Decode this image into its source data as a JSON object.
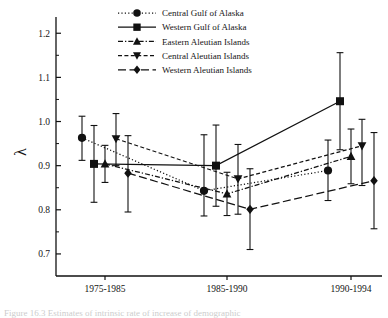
{
  "figure": {
    "background_color": "#ffffff",
    "ink_color": "#111111",
    "caption_partial": "Figure 16.3  Estimates of intrinsic rate of increase of demographic"
  },
  "chart_data": {
    "type": "line",
    "title": "",
    "xlabel": "",
    "ylabel": "λ",
    "categories": [
      "1975-1985",
      "1985-1990",
      "1990-1994"
    ],
    "ylim": [
      0.65,
      1.23
    ],
    "yticks": [
      "0.7",
      "0.8",
      "0.9",
      "1.0",
      "1.1",
      "1.2"
    ],
    "ytick_values": [
      0.7,
      0.8,
      0.9,
      1.0,
      1.1,
      1.2
    ],
    "minor_ticks": true,
    "grid": false,
    "legend_position": "top-center",
    "error_bars": "95% confidence interval",
    "series": [
      {
        "name": "Central Gulf of Alaska",
        "marker": "circle",
        "line_style": "dotted",
        "color": "#111111",
        "values": [
          0.963,
          0.843,
          0.889
        ],
        "err_low": [
          0.912,
          0.786,
          0.821
        ],
        "err_high": [
          1.012,
          0.97,
          0.958
        ]
      },
      {
        "name": "Western Gulf of Alaska",
        "marker": "square",
        "line_style": "solid",
        "color": "#111111",
        "values": [
          0.904,
          0.9,
          1.046
        ],
        "err_low": [
          0.817,
          0.808,
          0.936
        ],
        "err_high": [
          0.991,
          0.992,
          1.156
        ]
      },
      {
        "name": "Eastern Aleutian Islands",
        "marker": "triangle-up",
        "line_style": "dash-dot",
        "color": "#111111",
        "values": [
          0.904,
          0.836,
          0.921
        ],
        "err_low": [
          0.862,
          0.787,
          0.859
        ],
        "err_high": [
          0.946,
          0.885,
          0.983
        ]
      },
      {
        "name": "Central Aleutian Islands",
        "marker": "triangle-down",
        "line_style": "dashed",
        "color": "#111111",
        "values": [
          0.961,
          0.87,
          0.945
        ],
        "err_low": [
          0.9,
          0.79,
          0.855
        ],
        "err_high": [
          1.018,
          0.948,
          1.005
        ]
      },
      {
        "name": "Western Aleutian Islands",
        "marker": "diamond",
        "line_style": "long-dash",
        "color": "#111111",
        "values": [
          0.883,
          0.801,
          0.866
        ],
        "err_low": [
          0.795,
          0.71,
          0.757
        ],
        "err_high": [
          0.968,
          0.893,
          0.975
        ]
      }
    ]
  }
}
